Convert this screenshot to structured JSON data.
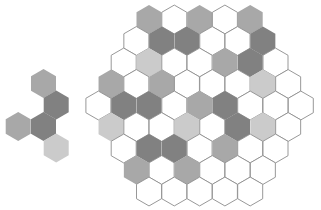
{
  "colors": {
    "W": "#ffffff",
    "L": "#cbcbcb",
    "M": "#a8a8a8",
    "D": "#818181",
    "outline": "#8c8c8c"
  },
  "board": {
    "hex_width": 25.3,
    "row_step": 21.5,
    "center_x": 199.6,
    "top_row_center_y": 19.5,
    "rows": [
      [
        "M",
        "W",
        "M",
        "W",
        "M"
      ],
      [
        "W",
        "D",
        "D",
        "W",
        "W",
        "D"
      ],
      [
        "W",
        "L",
        "W",
        "W",
        "M",
        "D",
        "W"
      ],
      [
        "M",
        "W",
        "M",
        "W",
        "W",
        "W",
        "L",
        "W"
      ],
      [
        "W",
        "D",
        "D",
        "W",
        "M",
        "D",
        "W",
        "W",
        "W"
      ],
      [
        "L",
        "W",
        "W",
        "L",
        "W",
        "D",
        "L",
        "W"
      ],
      [
        "W",
        "D",
        "D",
        "W",
        "M",
        "W",
        "W"
      ],
      [
        "M",
        "W",
        "M",
        "W",
        "W",
        "W"
      ],
      [
        "W",
        "W",
        "W",
        "W",
        "W"
      ]
    ]
  },
  "piece": {
    "hex_width": 25.3,
    "cells": [
      {
        "x": 43.5,
        "y": 83.5,
        "color": "M"
      },
      {
        "x": 56.2,
        "y": 105.0,
        "color": "D"
      },
      {
        "x": 18.2,
        "y": 126.5,
        "color": "M"
      },
      {
        "x": 43.5,
        "y": 126.5,
        "color": "D"
      },
      {
        "x": 56.2,
        "y": 148.0,
        "color": "L"
      }
    ]
  }
}
